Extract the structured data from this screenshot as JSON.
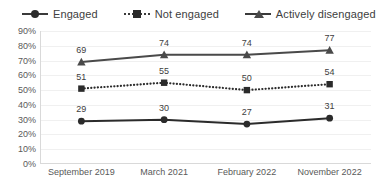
{
  "chart_data": {
    "type": "line",
    "title": "",
    "subtitle": "",
    "xlabel": "",
    "ylabel": "",
    "categories": [
      "September 2019",
      "March 2021",
      "February 2022",
      "November 2022"
    ],
    "series": [
      {
        "name": "Engaged",
        "values": [
          29,
          30,
          27,
          31
        ],
        "marker": "circle",
        "line_style": "solid",
        "color": "#2b2b2b"
      },
      {
        "name": "Not engaged",
        "values": [
          51,
          55,
          50,
          54
        ],
        "marker": "square",
        "line_style": "dotted",
        "color": "#2b2b2b"
      },
      {
        "name": "Actively disengaged",
        "values": [
          69,
          74,
          74,
          77
        ],
        "marker": "triangle",
        "line_style": "solid",
        "color": "#4a4a4a"
      }
    ],
    "ylim": [
      0,
      90
    ],
    "ytick_step": 10,
    "ytick_labels": [
      "0%",
      "10%",
      "20%",
      "30%",
      "40%",
      "50%",
      "60%",
      "70%",
      "80%",
      "90%"
    ],
    "ytick_values": [
      0,
      10,
      20,
      30,
      40,
      50,
      60,
      70,
      80,
      90
    ],
    "grid": true,
    "grid_axis": "y",
    "legend_position": "top-left",
    "data_labels": true,
    "data_label_format": "integer"
  },
  "legend": {
    "items": [
      {
        "label": "Engaged",
        "marker": "circle-marker-icon"
      },
      {
        "label": "Not engaged",
        "marker": "square-marker-icon"
      },
      {
        "label": "Actively disengaged",
        "marker": "triangle-marker-icon"
      }
    ]
  },
  "colors": {
    "engaged": "#2b2b2b",
    "not_engaged": "#2b2b2b",
    "actively_disengaged": "#4a4a4a",
    "gridline": "#f0f0f0",
    "axis": "#d9d9d9",
    "text": "#404040",
    "tick_text": "#595959",
    "background": "#ffffff"
  }
}
